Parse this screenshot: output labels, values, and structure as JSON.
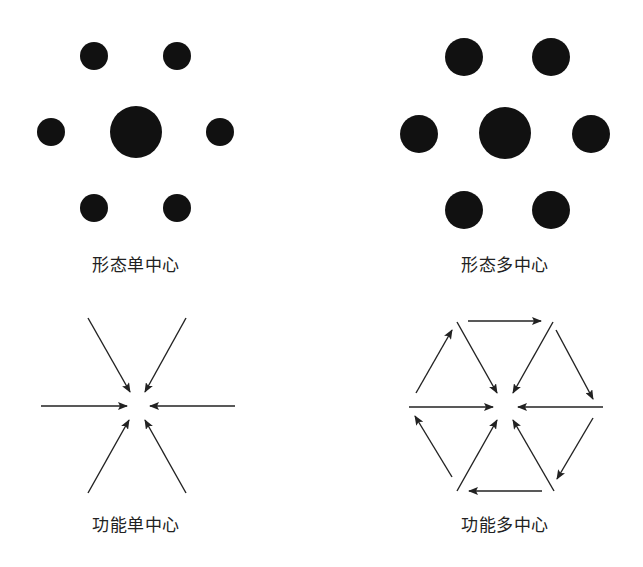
{
  "panels": [
    {
      "id": "morph-single",
      "label": "形态单中心",
      "label_pos": [
        136,
        251
      ]
    },
    {
      "id": "morph-multi",
      "label": "形态多中心",
      "label_pos": [
        505,
        251
      ]
    },
    {
      "id": "func-single",
      "label": "功能单中心",
      "label_pos": [
        136,
        511
      ]
    },
    {
      "id": "func-multi",
      "label": "功能多中心",
      "label_pos": [
        505,
        511
      ]
    }
  ],
  "colors": {
    "ink": "#111111",
    "arrow": "#222222",
    "background": "#ffffff"
  },
  "morph_single_dots": [
    {
      "cx": 136,
      "cy": 132,
      "r": 26
    },
    {
      "cx": 94,
      "cy": 56,
      "r": 14
    },
    {
      "cx": 177,
      "cy": 56,
      "r": 14
    },
    {
      "cx": 51,
      "cy": 132,
      "r": 14
    },
    {
      "cx": 220,
      "cy": 132,
      "r": 14
    },
    {
      "cx": 94,
      "cy": 208,
      "r": 14
    },
    {
      "cx": 177,
      "cy": 208,
      "r": 14
    }
  ],
  "morph_multi_dots": [
    {
      "cx": 505,
      "cy": 133,
      "r": 26
    },
    {
      "cx": 464,
      "cy": 57,
      "r": 19
    },
    {
      "cx": 551,
      "cy": 57,
      "r": 19
    },
    {
      "cx": 419,
      "cy": 134,
      "r": 19
    },
    {
      "cx": 591,
      "cy": 134,
      "r": 19
    },
    {
      "cx": 464,
      "cy": 210,
      "r": 19
    },
    {
      "cx": 551,
      "cy": 210,
      "r": 19
    }
  ],
  "func_single_arrows": [
    [
      88,
      318,
      130,
      392
    ],
    [
      186,
      318,
      145,
      392
    ],
    [
      41,
      406,
      127,
      406
    ],
    [
      235,
      406,
      150,
      406
    ],
    [
      88,
      493,
      129,
      420
    ],
    [
      186,
      493,
      145,
      420
    ]
  ],
  "func_multi_arrows": [
    [
      457,
      322,
      497,
      393
    ],
    [
      553,
      322,
      513,
      393
    ],
    [
      409,
      407,
      493,
      407
    ],
    [
      603,
      407,
      518,
      407
    ],
    [
      457,
      491,
      497,
      420
    ],
    [
      554,
      491,
      513,
      420
    ],
    [
      468,
      321,
      541,
      321
    ],
    [
      556,
      330,
      593,
      399
    ],
    [
      593,
      418,
      557,
      479
    ],
    [
      542,
      491,
      469,
      491
    ],
    [
      452,
      477,
      415,
      416
    ],
    [
      416,
      393,
      452,
      330
    ]
  ]
}
